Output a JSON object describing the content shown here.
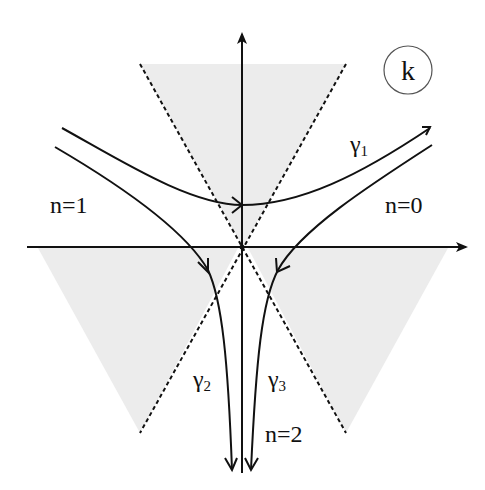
{
  "diagram": {
    "type": "complex-plane contour diagram",
    "plane_label": "k",
    "regions": [
      {
        "label": "n=0"
      },
      {
        "label": "n=1"
      },
      {
        "label": "n=2"
      }
    ],
    "contours": [
      {
        "label": "γ",
        "subscript": "1"
      },
      {
        "label": "γ",
        "subscript": "2"
      },
      {
        "label": "γ",
        "subscript": "3"
      }
    ],
    "colors": {
      "ink": "#111111",
      "shade": "#ececec",
      "background": "#ffffff"
    }
  }
}
